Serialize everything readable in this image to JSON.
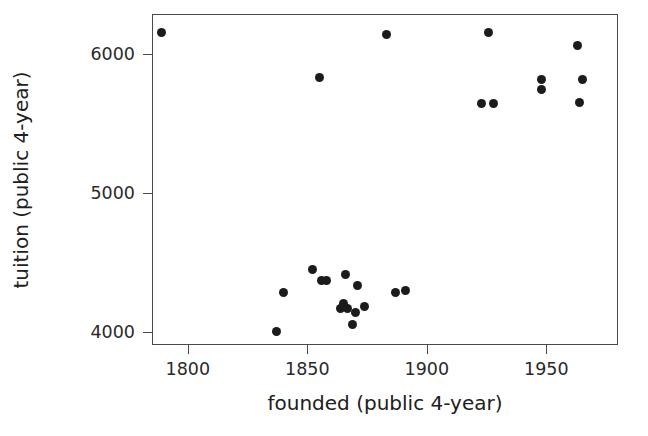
{
  "chart_data": {
    "type": "scatter",
    "title": "",
    "xlabel": "founded (public 4-year)",
    "ylabel": "tuition (public 4-year)",
    "xlim": [
      1785,
      1980
    ],
    "ylim": [
      3910,
      6290
    ],
    "xticks": [
      1800,
      1850,
      1900,
      1950
    ],
    "xtick_labels": [
      "1800",
      "1850",
      "1900",
      "1950"
    ],
    "yticks": [
      4000,
      5000,
      6000
    ],
    "ytick_labels": [
      "4000",
      "5000",
      "6000"
    ],
    "grid": false,
    "legend": null,
    "marker": {
      "shape": "circle",
      "color": "#1b1b1b",
      "size": 9
    },
    "points": [
      {
        "x": 1789,
        "y": 6155
      },
      {
        "x": 1855,
        "y": 5830
      },
      {
        "x": 1883,
        "y": 6140
      },
      {
        "x": 1926,
        "y": 6160
      },
      {
        "x": 1948,
        "y": 5820
      },
      {
        "x": 1948,
        "y": 5745
      },
      {
        "x": 1923,
        "y": 5650
      },
      {
        "x": 1928,
        "y": 5650
      },
      {
        "x": 1963,
        "y": 6065
      },
      {
        "x": 1965,
        "y": 5820
      },
      {
        "x": 1964,
        "y": 5655
      },
      {
        "x": 1837,
        "y": 4010
      },
      {
        "x": 1840,
        "y": 4285
      },
      {
        "x": 1852,
        "y": 4450
      },
      {
        "x": 1856,
        "y": 4375
      },
      {
        "x": 1858,
        "y": 4375
      },
      {
        "x": 1864,
        "y": 4175
      },
      {
        "x": 1867,
        "y": 4175
      },
      {
        "x": 1866,
        "y": 4415
      },
      {
        "x": 1871,
        "y": 4340
      },
      {
        "x": 1865,
        "y": 4205
      },
      {
        "x": 1874,
        "y": 4190
      },
      {
        "x": 1870,
        "y": 4145
      },
      {
        "x": 1869,
        "y": 4055
      },
      {
        "x": 1887,
        "y": 4290
      },
      {
        "x": 1891,
        "y": 4300
      }
    ]
  },
  "axis_style": {
    "frame_color": "#4a4a4a",
    "text_color": "#202020",
    "background": "#ffffff"
  }
}
